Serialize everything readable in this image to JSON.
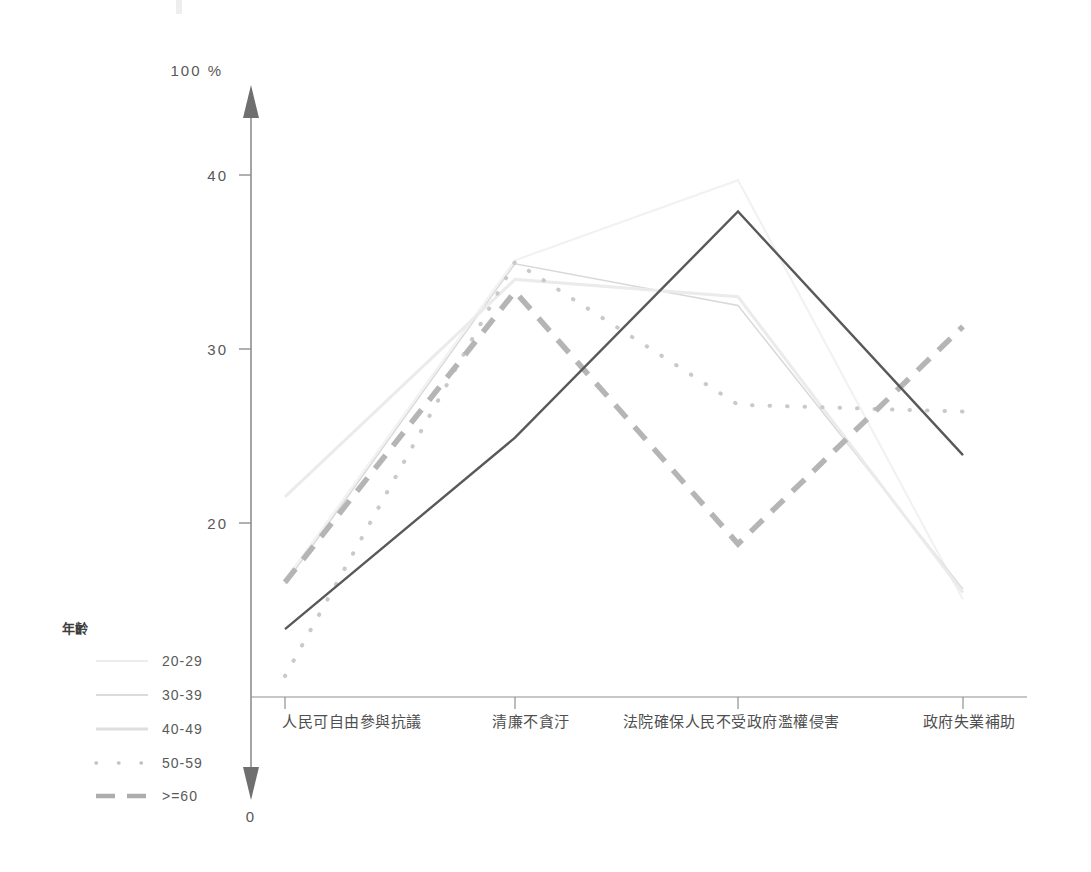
{
  "chart_data": {
    "type": "line",
    "title": "",
    "subtitle": "",
    "xlabel": "",
    "ylabel": "",
    "axis_top_label": "100 %",
    "axis_origin_label": "0",
    "grid": false,
    "legend_position": "left",
    "legend_title": "年齡",
    "ylim": [
      0,
      100
    ],
    "y_ticks": [
      20,
      30,
      40
    ],
    "y_tick_labels": [
      "20",
      "30",
      "40"
    ],
    "categories": [
      "人民可自由參與抗議",
      "清廉不貪汙",
      "法院確保人民不受政府濫權侵害",
      "政府失業補助"
    ],
    "series": [
      {
        "name": "20-29",
        "style": "solid-faint",
        "color": "#f2f2f2",
        "values": [
          16.7,
          35.1,
          39.7,
          15.6
        ]
      },
      {
        "name": "30-39",
        "style": "solid-light",
        "color": "#d8d8d8",
        "values": [
          16.5,
          34.9,
          32.5,
          16.2
        ]
      },
      {
        "name": "40-49",
        "style": "solid-pale",
        "color": "#ebebeb",
        "values": [
          21.5,
          34.0,
          33.0,
          16.0
        ]
      },
      {
        "name": "50-59",
        "style": "dotted",
        "color": "#c9c9c9",
        "values": [
          11.2,
          35.0,
          26.8,
          26.4
        ]
      },
      {
        "name": ">=60",
        "style": "dashed",
        "color": "#b5b5b5",
        "values": [
          16.6,
          33.3,
          18.8,
          31.3
        ]
      },
      {
        "name": "main-dark",
        "style": "solid-dark",
        "color": "#595959",
        "values": [
          13.9,
          24.9,
          37.9,
          23.9
        ]
      }
    ]
  },
  "legend": {
    "title": "年齡",
    "items": [
      {
        "label": "20-29",
        "swatch": "solid-faint",
        "color": "#eaeaea"
      },
      {
        "label": "30-39",
        "swatch": "solid-light",
        "color": "#d0d0d0"
      },
      {
        "label": "40-49",
        "swatch": "solid-pale",
        "color": "#dcdcdc"
      },
      {
        "label": "50-59",
        "swatch": "dotted",
        "color": "#c4c4c4"
      },
      {
        "label": ">=60",
        "swatch": "dashed",
        "color": "#b0b0b0"
      }
    ]
  },
  "axis": {
    "top_label": "100 %",
    "origin_label": "0",
    "tick_20": "20",
    "tick_30": "30",
    "tick_40": "40"
  },
  "colors": {
    "axis": "#8a8a8a",
    "text": "#595959",
    "dark_series": "#595959",
    "background": "#ffffff"
  }
}
